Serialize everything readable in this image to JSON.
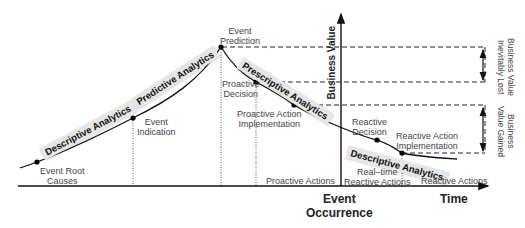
{
  "axes": {
    "x_label": "Time",
    "y_label": "Business Value",
    "event_occurrence_line1": "Event",
    "event_occurrence_line2": "Occurrence"
  },
  "analytics_bands": [
    {
      "label": "Descriptive Analytics"
    },
    {
      "label": "Predictive Analytics"
    },
    {
      "label": "Prescriptive Analytics"
    },
    {
      "label": "Descriptive Analytics"
    }
  ],
  "points": {
    "root_causes": {
      "line1": "Event Root",
      "line2": "Causes"
    },
    "indication": {
      "line1": "Event",
      "line2": "Indication"
    },
    "prediction": {
      "line1": "Event",
      "line2": "Prediction"
    },
    "proactive_decision": {
      "line1": "Proactive",
      "line2": "Decision"
    },
    "proactive_impl": {
      "line1": "Proactive Action",
      "line2": "Implementation"
    },
    "reactive_decision": {
      "line1": "Reactive",
      "line2": "Decision"
    },
    "reactive_impl": {
      "line1": "Reactive Action",
      "line2": "Implementation"
    }
  },
  "regions": {
    "proactive_actions": "Proactive Actions",
    "realtime_line1": "Real–time",
    "realtime_line2": "Reactive Actions",
    "reactive_actions": "Reactive Actions"
  },
  "brackets": {
    "lost_line1": "Business Value",
    "lost_line2": "Inevitably Lost",
    "gained_line1": "Business",
    "gained_line2": "Value Gained"
  }
}
